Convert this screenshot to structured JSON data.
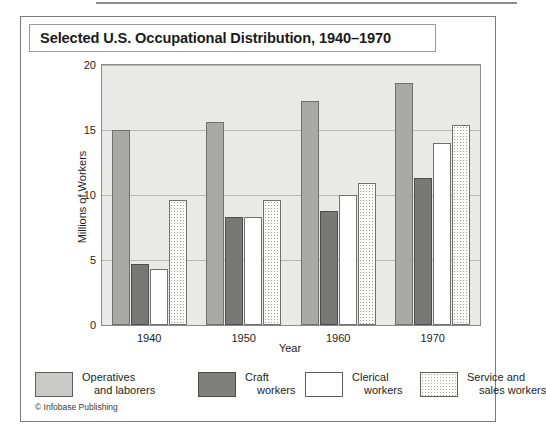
{
  "figure": {
    "title": "Selected U.S. Occupational Distribution, 1940–1970",
    "copyright": "© Infobase Publishing"
  },
  "chart_data": {
    "type": "bar",
    "title": "Selected U.S. Occupational Distribution, 1940–1970",
    "xlabel": "Year",
    "ylabel": "Millions of Workers",
    "categories": [
      "1940",
      "1950",
      "1960",
      "1970"
    ],
    "ylim": [
      0,
      20
    ],
    "yticks": [
      0,
      5,
      10,
      15,
      20
    ],
    "ytick_labels": [
      "0",
      "5",
      "10",
      "15",
      "20"
    ],
    "grid": true,
    "legend_position": "bottom",
    "series": [
      {
        "name": "Operatives and laborers",
        "name_line1": "Operatives",
        "name_line2": "and laborers",
        "color": "#a9a9a7",
        "values": [
          15.0,
          15.6,
          17.2,
          18.6
        ]
      },
      {
        "name": "Craft workers",
        "name_line1": "Craft",
        "name_line2": "workers",
        "color": "#787876",
        "values": [
          4.7,
          8.3,
          8.8,
          11.3
        ]
      },
      {
        "name": "Clerical workers",
        "name_line1": "Clerical",
        "name_line2": "workers",
        "color": "#ffffff",
        "values": [
          4.3,
          8.3,
          10.0,
          14.0
        ]
      },
      {
        "name": "Service and sales workers",
        "name_line1": "Service and",
        "name_line2": "sales workers",
        "color": "#fbfbfa",
        "values": [
          9.6,
          9.6,
          10.9,
          15.4
        ]
      }
    ]
  }
}
